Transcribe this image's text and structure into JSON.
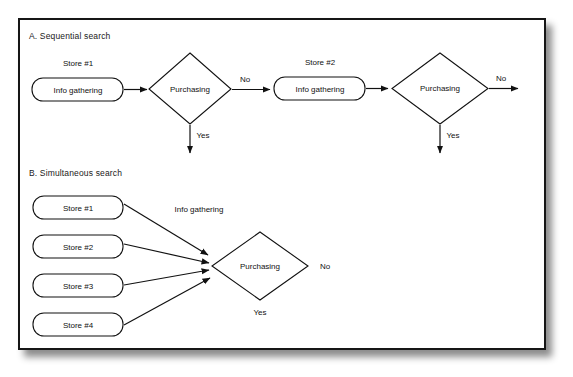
{
  "figure": {
    "background_color": "#ffffff",
    "frame_color": "#161616",
    "line_color": "#111111"
  },
  "sections": [
    {
      "id": "sequential",
      "title": "A. Sequential search",
      "stores": [
        {
          "caption": "Store #1",
          "box_label": "Info gathering"
        },
        {
          "caption": "Store #2",
          "box_label": "Info gathering"
        }
      ],
      "decisions": [
        {
          "label": "Purchasing",
          "yes_label": "Yes",
          "no_label": "No"
        },
        {
          "label": "Purchasing",
          "yes_label": "Yes",
          "no_label": "No"
        }
      ]
    },
    {
      "id": "simultaneous",
      "title": "B. Simultaneous search",
      "stores": [
        {
          "box_label": "Store #1"
        },
        {
          "box_label": "Store #2"
        },
        {
          "box_label": "Store #3"
        },
        {
          "box_label": "Store #4"
        }
      ],
      "edge_label": "Info gathering",
      "decision": {
        "label": "Purchasing",
        "yes_label": "Yes",
        "no_label": "No"
      }
    }
  ]
}
